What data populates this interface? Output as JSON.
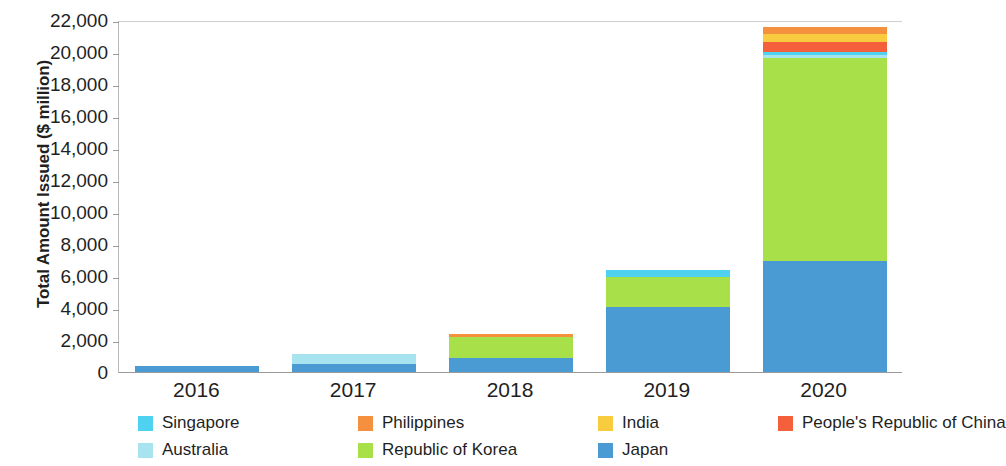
{
  "chart_data": {
    "type": "bar",
    "stacked": true,
    "title": "",
    "subtitle": "",
    "xlabel": "",
    "ylabel": "Total Amount Issued ($ million)",
    "categories": [
      "2016",
      "2017",
      "2018",
      "2019",
      "2020"
    ],
    "ylim": [
      0,
      22000
    ],
    "ytick_step": 2000,
    "yticks": [
      0,
      2000,
      4000,
      6000,
      8000,
      10000,
      12000,
      14000,
      16000,
      18000,
      20000,
      22000
    ],
    "ytick_labels": [
      "0",
      "2,000",
      "4,000",
      "6,000",
      "8,000",
      "10,000",
      "12,000",
      "14,000",
      "16,000",
      "18,000",
      "20,000",
      "22,000"
    ],
    "grid": false,
    "legend_position": "bottom",
    "series": [
      {
        "name": "Japan",
        "color": "#4a9bd4",
        "values": [
          400,
          500,
          900,
          4050,
          6950
        ]
      },
      {
        "name": "Republic of Korea",
        "color": "#a8e04a",
        "values": [
          0,
          0,
          1300,
          1900,
          12650
        ]
      },
      {
        "name": "Australia",
        "color": "#a8e4f0",
        "values": [
          0,
          600,
          0,
          0,
          200
        ]
      },
      {
        "name": "Singapore",
        "color": "#4fd2f0",
        "values": [
          0,
          0,
          0,
          450,
          200
        ]
      },
      {
        "name": "People's Republic of China",
        "color": "#f4603c",
        "values": [
          0,
          0,
          0,
          0,
          650
        ]
      },
      {
        "name": "India",
        "color": "#f9cc3f",
        "values": [
          0,
          0,
          0,
          0,
          500
        ]
      },
      {
        "name": "Philippines",
        "color": "#f5903f",
        "values": [
          0,
          0,
          200,
          0,
          400
        ]
      }
    ],
    "totals": [
      400,
      1100,
      2400,
      6400,
      21550
    ]
  },
  "legend": {
    "entries": [
      {
        "label": "Singapore",
        "color": "#4fd2f0"
      },
      {
        "label": "Philippines",
        "color": "#f5903f"
      },
      {
        "label": "India",
        "color": "#f9cc3f"
      },
      {
        "label": "People's Republic of China",
        "color": "#f4603c"
      },
      {
        "label": "Australia",
        "color": "#a8e4f0"
      },
      {
        "label": "Republic of Korea",
        "color": "#a8e04a"
      },
      {
        "label": "Japan",
        "color": "#4a9bd4"
      }
    ]
  }
}
